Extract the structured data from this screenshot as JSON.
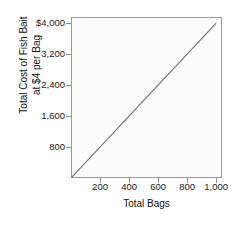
{
  "chart_data": {
    "type": "line",
    "title": "",
    "subtitle": "",
    "xlabel": "Total Bags",
    "ylabel_line1": "Total Cost of Fish Bait",
    "ylabel_line2": "at $4 per Bag",
    "xlim": [
      0,
      1040
    ],
    "ylim": [
      0,
      4160
    ],
    "grid": false,
    "legend": null,
    "x_ticks": [
      200,
      400,
      600,
      800,
      1000
    ],
    "x_tick_labels": [
      "200",
      "400",
      "600",
      "800",
      "1,000"
    ],
    "y_ticks": [
      800,
      1600,
      2400,
      3200,
      4000
    ],
    "y_tick_labels": [
      "800",
      "1,600",
      "2,400",
      "3,200",
      "$4,000"
    ],
    "series": [
      {
        "name": "Total cost",
        "color": "#6e6e6e",
        "x": [
          0,
          1000
        ],
        "values": [
          0,
          4000
        ]
      }
    ],
    "annotations": [],
    "colors": {
      "line": "#6e6e6e",
      "axis": "#9a9a9a",
      "text": "#111111",
      "background": "#ffffff",
      "plot_background": "#fcfcfc"
    }
  }
}
